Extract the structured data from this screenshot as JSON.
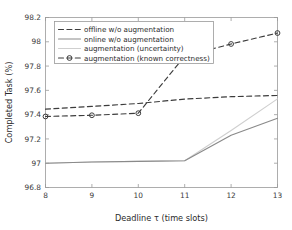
{
  "chart_data": {
    "type": "line",
    "title": "",
    "xlabel": "Deadline τ (time slots)",
    "ylabel": "Completed Task (%)",
    "x": [
      8,
      9,
      10,
      11,
      12,
      13
    ],
    "xlim": [
      8,
      13
    ],
    "ylim": [
      96.8,
      98.2
    ],
    "xticks": [
      "8",
      "9",
      "10",
      "11",
      "12",
      "13"
    ],
    "yticks": [
      "96.8",
      "97",
      "97.2",
      "97.4",
      "97.6",
      "97.8",
      "98",
      "98.2"
    ],
    "ytick_values": [
      96.8,
      97,
      97.2,
      97.4,
      97.6,
      97.8,
      98,
      98.2
    ],
    "grid": false,
    "legend_position": "upper left",
    "series": [
      {
        "name": "offline w/o augmentation",
        "style": "dashed",
        "marker": "none",
        "color": "#3c3c3c",
        "values": [
          97.445,
          97.468,
          97.492,
          97.528,
          97.548,
          97.558
        ]
      },
      {
        "name": "online w/o augmentation",
        "style": "solid",
        "marker": "none",
        "color": "#8a8a8a",
        "values": [
          97.0,
          97.01,
          97.015,
          97.02,
          97.23,
          97.37
        ]
      },
      {
        "name": "augmentation (uncertainty)",
        "style": "solid",
        "marker": "none",
        "color": "#cfcfcf",
        "values": [
          97.0,
          97.01,
          97.015,
          97.02,
          97.27,
          97.53
        ]
      },
      {
        "name": "augmentation (known correctness)",
        "style": "dashed",
        "marker": "circle",
        "color": "#3c3c3c",
        "values": [
          97.385,
          97.395,
          97.412,
          97.882,
          97.982,
          98.072
        ]
      }
    ]
  },
  "legend": {
    "items": [
      "offline w/o augmentation",
      "online w/o augmentation",
      "augmentation (uncertainty)",
      "augmentation (known correctness)"
    ]
  },
  "colors": {
    "axis": "#9a9a9a",
    "dark_series": "#3c3c3c",
    "mid_gray_series": "#8a8a8a",
    "light_gray_series": "#cfcfcf",
    "text": "#2b2b2b"
  }
}
